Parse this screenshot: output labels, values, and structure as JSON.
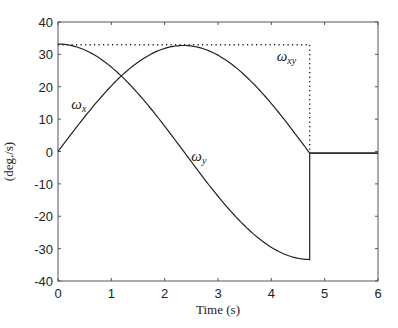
{
  "chart_data": {
    "type": "line",
    "title": "",
    "xlabel": "Time (s)",
    "ylabel": "(deg./s)",
    "xlim": [
      0,
      6
    ],
    "ylim": [
      -40,
      40
    ],
    "xticks": [
      0,
      1,
      2,
      3,
      4,
      5,
      6
    ],
    "yticks": [
      -40,
      -30,
      -20,
      -10,
      0,
      10,
      20,
      30,
      40
    ],
    "grid": false,
    "legend": "inline labels",
    "series": [
      {
        "name": "ω_x",
        "label_main": "ω",
        "label_sub": "x",
        "style": "solid",
        "x": [
          0,
          0.5,
          1.0,
          1.18,
          1.5,
          2.0,
          2.36,
          2.5,
          3.0,
          3.5,
          4.0,
          4.5,
          4.72,
          4.72,
          6.0
        ],
        "y": [
          33.2,
          31.6,
          26.0,
          23.5,
          18.0,
          8.5,
          0.0,
          -3.0,
          -12.5,
          -22.0,
          -28.5,
          -33.0,
          -33.5,
          -0.5,
          -0.5
        ]
      },
      {
        "name": "ω_y",
        "label_main": "ω",
        "label_sub": "y",
        "style": "solid",
        "x": [
          0,
          0.5,
          1.0,
          1.18,
          1.5,
          2.0,
          2.36,
          2.5,
          3.0,
          3.5,
          4.0,
          4.5,
          4.72,
          6.0
        ],
        "y": [
          0.0,
          10.5,
          20.0,
          23.5,
          28.5,
          32.5,
          33.0,
          32.8,
          30.0,
          24.0,
          15.5,
          5.0,
          -0.5,
          -0.5
        ]
      },
      {
        "name": "ω_xy",
        "label_main": "ω",
        "label_sub": "xy",
        "style": "dotted",
        "x": [
          0,
          4.72,
          4.72
        ],
        "y": [
          33.0,
          33.0,
          -0.5
        ]
      }
    ],
    "annotations": [
      {
        "text": "ω_x",
        "x": 0.25,
        "y": 13
      },
      {
        "text": "ω_y",
        "x": 2.5,
        "y": -3
      },
      {
        "text": "ω_xy",
        "x": 4.1,
        "y": 28
      }
    ]
  }
}
